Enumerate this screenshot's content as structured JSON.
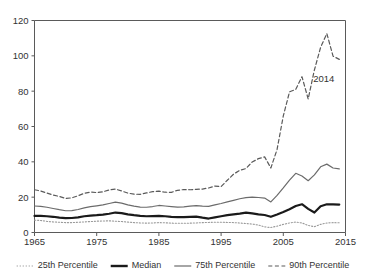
{
  "chart_data": {
    "type": "line",
    "title": "",
    "subtitle": "",
    "xlabel": "",
    "ylabel": "",
    "xlim": [
      1965,
      2015
    ],
    "ylim": [
      0,
      120
    ],
    "grid": false,
    "legend_position": "bottom",
    "x_ticks": [
      "1965",
      "1975",
      "1985",
      "1995",
      "2005",
      "2015"
    ],
    "x_tick_values": [
      1965,
      1975,
      1985,
      1995,
      2005,
      2015
    ],
    "y_ticks": [
      "0",
      "20",
      "40",
      "60",
      "80",
      "100",
      "120"
    ],
    "y_tick_values": [
      0,
      20,
      40,
      60,
      80,
      100,
      120
    ],
    "x": [
      1965,
      1966,
      1967,
      1968,
      1969,
      1970,
      1971,
      1972,
      1973,
      1974,
      1975,
      1976,
      1977,
      1978,
      1979,
      1980,
      1981,
      1982,
      1983,
      1984,
      1985,
      1986,
      1987,
      1988,
      1989,
      1990,
      1991,
      1992,
      1993,
      1994,
      1995,
      1996,
      1997,
      1998,
      1999,
      2000,
      2001,
      2002,
      2003,
      2004,
      2005,
      2006,
      2007,
      2008,
      2009,
      2010,
      2011,
      2012,
      2013,
      2014
    ],
    "series": [
      {
        "name": "25th Percentile",
        "style": "dotted",
        "color": "#9a9a9a",
        "width": 1.1,
        "values": [
          7.0,
          6.8,
          6.3,
          6.0,
          5.8,
          5.6,
          5.6,
          5.8,
          6.0,
          6.2,
          6.4,
          6.5,
          6.6,
          6.4,
          6.2,
          5.9,
          5.6,
          5.4,
          5.3,
          5.4,
          5.6,
          5.5,
          5.3,
          5.2,
          5.2,
          5.3,
          5.4,
          5.6,
          5.7,
          5.8,
          5.8,
          5.7,
          5.6,
          5.4,
          5.1,
          4.8,
          4.2,
          3.2,
          2.8,
          3.6,
          4.6,
          5.4,
          5.9,
          5.4,
          4.0,
          3.3,
          4.6,
          5.4,
          5.6,
          5.5
        ]
      },
      {
        "name": "Median",
        "style": "solid",
        "color": "#1a1a1a",
        "width": 2.2,
        "values": [
          9.4,
          9.4,
          9.2,
          8.9,
          8.4,
          8.1,
          8.2,
          8.6,
          9.2,
          9.6,
          9.8,
          10.1,
          10.6,
          11.3,
          11.0,
          10.3,
          9.8,
          9.4,
          9.2,
          9.3,
          9.4,
          9.2,
          8.9,
          8.7,
          8.7,
          8.9,
          9.0,
          8.4,
          7.9,
          8.6,
          9.2,
          9.8,
          10.3,
          10.7,
          11.2,
          10.8,
          10.3,
          9.9,
          8.9,
          10.2,
          11.6,
          13.2,
          15.0,
          16.0,
          13.4,
          11.3,
          14.9,
          16.0,
          15.9,
          15.8
        ]
      },
      {
        "name": "75th Percentile",
        "style": "solid",
        "color": "#6b6b6b",
        "width": 1.2,
        "values": [
          15.0,
          14.8,
          14.3,
          13.6,
          12.9,
          12.3,
          12.4,
          13.0,
          13.9,
          14.6,
          15.1,
          15.6,
          16.4,
          17.2,
          16.6,
          15.6,
          14.9,
          14.4,
          14.3,
          14.7,
          15.3,
          15.0,
          14.7,
          14.4,
          14.5,
          14.9,
          15.2,
          14.9,
          14.8,
          15.6,
          16.4,
          17.3,
          18.2,
          19.1,
          19.7,
          20.0,
          19.8,
          19.5,
          17.3,
          21.0,
          25.2,
          29.6,
          33.5,
          32.0,
          29.3,
          32.6,
          37.2,
          38.7,
          36.5,
          36.0
        ]
      },
      {
        "name": "90th Percentile",
        "style": "dashed",
        "color": "#5a5a5a",
        "width": 1.2,
        "values": [
          24.2,
          23.5,
          22.3,
          21.2,
          20.4,
          19.3,
          19.6,
          20.8,
          22.2,
          22.9,
          22.6,
          23.0,
          24.1,
          24.6,
          23.5,
          22.3,
          21.7,
          21.6,
          22.4,
          23.1,
          23.4,
          22.8,
          22.7,
          23.9,
          24.3,
          24.2,
          24.4,
          24.6,
          25.2,
          26.3,
          26.0,
          29.6,
          33.0,
          35.2,
          36.2,
          39.9,
          41.8,
          42.8,
          36.5,
          47.0,
          66.0,
          79.6,
          81.0,
          88.2,
          75.6,
          92.0,
          104.8,
          112.6,
          99.8,
          98.0
        ]
      }
    ],
    "annotations": [
      {
        "text": "2014",
        "x": 2011.5,
        "y": 85
      }
    ]
  },
  "legend": {
    "items": [
      {
        "label": "25th Percentile",
        "style": "dotted"
      },
      {
        "label": "Median",
        "style": "solid-thick"
      },
      {
        "label": "75th Percentile",
        "style": "solid-thin"
      },
      {
        "label": "90th Percentile",
        "style": "dashed"
      }
    ]
  }
}
